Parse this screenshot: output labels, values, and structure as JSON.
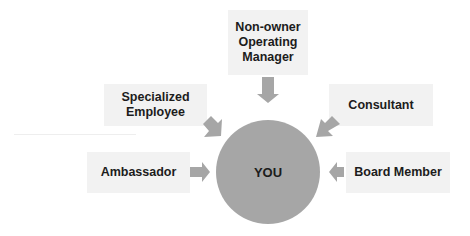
{
  "diagram": {
    "center": {
      "label": "YOU",
      "color": "#a6a6a6"
    },
    "nodes": [
      {
        "id": "top",
        "label": "Non-owner\nOperating\nManager"
      },
      {
        "id": "upper-left",
        "label": "Specialized\nEmployee"
      },
      {
        "id": "upper-right",
        "label": "Consultant"
      },
      {
        "id": "left",
        "label": "Ambassador"
      },
      {
        "id": "right",
        "label": "Board Member"
      }
    ],
    "colors": {
      "box": "#f2f2f2",
      "arrow": "#a6a6a6",
      "text": "#1c1c1c"
    }
  }
}
